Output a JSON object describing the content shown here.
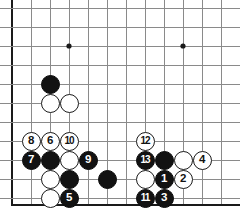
{
  "diagram": {
    "kind": "go-board-diagram",
    "board_region": "bottom-left corner",
    "colors": {
      "board_background": "#ffffff",
      "grid_line": "#8a8a8a",
      "border_line": "#1a1a1a",
      "black_stone": "#121212",
      "white_stone": "#ffffff",
      "black_label_text": "#ffffff",
      "white_label_text": "#121212"
    },
    "grid": {
      "columns": 12,
      "rows": 11,
      "spacing_px": 19,
      "origin_x_px": 12,
      "origin_y_px": 8,
      "left_edge_is_board_border": true,
      "bottom_edge_is_board_border": true,
      "border_y_px": 205,
      "star_points": [
        {
          "col": 3,
          "row": 2
        },
        {
          "col": 9,
          "row": 2
        }
      ]
    },
    "stones": [
      {
        "id": "b-upper-left",
        "color": "black",
        "col": 2,
        "row": 4,
        "label": ""
      },
      {
        "id": "w-upper-left-1",
        "color": "white",
        "col": 2,
        "row": 5,
        "label": ""
      },
      {
        "id": "w-upper-left-2",
        "color": "white",
        "col": 3,
        "row": 5,
        "label": ""
      },
      {
        "id": "move-8",
        "color": "white",
        "col": 1,
        "row": 7,
        "label": "8"
      },
      {
        "id": "move-6",
        "color": "white",
        "col": 2,
        "row": 7,
        "label": "6"
      },
      {
        "id": "move-10",
        "color": "white",
        "col": 3,
        "row": 7,
        "label": "10"
      },
      {
        "id": "move-12",
        "color": "white",
        "col": 7,
        "row": 7,
        "label": "12"
      },
      {
        "id": "move-7",
        "color": "black",
        "col": 1,
        "row": 8,
        "label": "7"
      },
      {
        "id": "b-left-mid",
        "color": "black",
        "col": 2,
        "row": 8,
        "label": ""
      },
      {
        "id": "w-left-mid",
        "color": "white",
        "col": 3,
        "row": 8,
        "label": ""
      },
      {
        "id": "move-9",
        "color": "black",
        "col": 4,
        "row": 8,
        "label": "9"
      },
      {
        "id": "move-13",
        "color": "black",
        "col": 7,
        "row": 8,
        "label": "13"
      },
      {
        "id": "b-right-mid",
        "color": "black",
        "col": 8,
        "row": 8,
        "label": ""
      },
      {
        "id": "w-right-mid",
        "color": "white",
        "col": 9,
        "row": 8,
        "label": ""
      },
      {
        "id": "move-4",
        "color": "white",
        "col": 10,
        "row": 8,
        "label": "4"
      },
      {
        "id": "w-left-low",
        "color": "white",
        "col": 2,
        "row": 9,
        "label": ""
      },
      {
        "id": "b-left-low",
        "color": "black",
        "col": 3,
        "row": 9,
        "label": ""
      },
      {
        "id": "b-center-low",
        "color": "black",
        "col": 5,
        "row": 9,
        "label": ""
      },
      {
        "id": "w-right-low",
        "color": "white",
        "col": 7,
        "row": 9,
        "label": ""
      },
      {
        "id": "move-1",
        "color": "black",
        "col": 8,
        "row": 9,
        "label": "1"
      },
      {
        "id": "move-2",
        "color": "white",
        "col": 9,
        "row": 9,
        "label": "2"
      },
      {
        "id": "w-left-bottom",
        "color": "white",
        "col": 2,
        "row": 10,
        "label": ""
      },
      {
        "id": "move-5",
        "color": "black",
        "col": 3,
        "row": 10,
        "label": "5"
      },
      {
        "id": "move-11",
        "color": "black",
        "col": 7,
        "row": 10,
        "label": "11"
      },
      {
        "id": "move-3",
        "color": "black",
        "col": 8,
        "row": 10,
        "label": "3"
      }
    ]
  }
}
